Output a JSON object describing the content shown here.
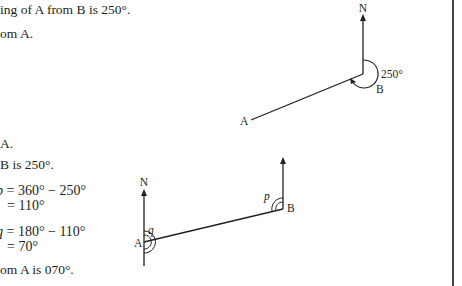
{
  "text": {
    "line1": "ing of A from B is 250°.",
    "line2": "om A.",
    "line3": "A.",
    "line4": "B is 250°.",
    "eq1_var": "p",
    "eq1_rhs": " = 360° − 250°",
    "eq1_res": "= 110°",
    "eq2_var": "q",
    "eq2_rhs": " = 180° − 110°",
    "eq2_res": "= 70°",
    "line_final": "om A is 070°."
  },
  "diagram_top": {
    "north_label": "N",
    "angle_label": "250°",
    "point_b": "B",
    "point_a": "A"
  },
  "diagram_bottom": {
    "north_label": "N",
    "point_a": "A",
    "point_b": "B",
    "angle_p": "p",
    "angle_q": "q"
  }
}
